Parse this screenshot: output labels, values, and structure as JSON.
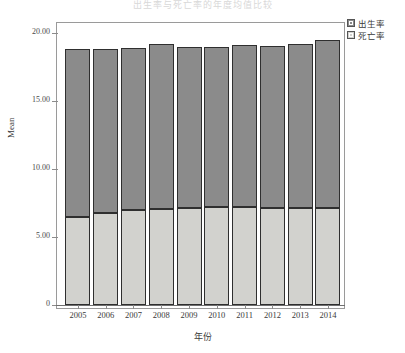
{
  "figure": {
    "clipped_title": "出生率与死亡率的年度均值比较",
    "y_axis_title": "Mean",
    "x_axis_title": "年份",
    "y_ticks": [
      "20.00",
      "15.00",
      "10.00",
      "5.00",
      "0"
    ],
    "colors": {
      "birth": "#8b8b8b",
      "death": "#d2d2ce",
      "frame": "#9a9a9a",
      "outline": "#2f2f2f"
    }
  },
  "legend": {
    "items": [
      {
        "label": "出生率",
        "swatch": "birth"
      },
      {
        "label": "死亡率",
        "swatch": "death"
      }
    ]
  },
  "chart_data": {
    "type": "bar",
    "subtype": "stacked",
    "title": "出生率与死亡率的年度均值比较",
    "xlabel": "年份",
    "ylabel": "Mean",
    "ylim": [
      0,
      20.5
    ],
    "yticks": [
      0,
      5,
      10,
      15,
      20
    ],
    "ytick_labels": [
      "0",
      "5.00",
      "10.00",
      "15.00",
      "20.00"
    ],
    "grid": false,
    "legend_position": "top-right-outside",
    "categories": [
      "2005",
      "2006",
      "2007",
      "2008",
      "2009",
      "2010",
      "2011",
      "2012",
      "2013",
      "2014"
    ],
    "series": [
      {
        "name": "死亡率",
        "values": [
          6.47,
          6.78,
          6.95,
          7.06,
          7.13,
          7.2,
          7.18,
          7.15,
          7.15,
          7.15
        ]
      },
      {
        "name": "出生率",
        "values": [
          12.33,
          12.04,
          11.98,
          12.14,
          11.83,
          11.74,
          11.94,
          11.92,
          12.01,
          12.35
        ]
      }
    ],
    "stack_totals": [
      18.8,
      18.82,
      18.93,
      19.2,
      18.96,
      18.94,
      19.12,
      19.07,
      19.16,
      19.5
    ]
  }
}
